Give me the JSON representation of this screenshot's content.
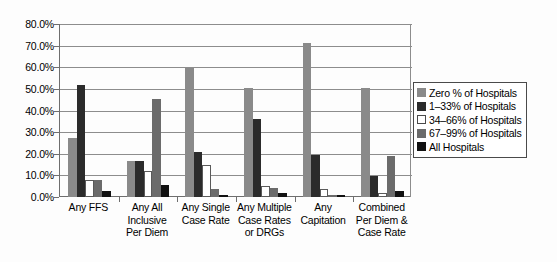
{
  "chart_data": {
    "type": "bar",
    "title": "",
    "xlabel": "",
    "ylabel": "",
    "ylim": [
      0,
      80
    ],
    "ytick_labels": [
      "80.0%",
      "70.0%",
      "60.0%",
      "50.0%",
      "40.0%",
      "30.0%",
      "20.0%",
      "10.0%",
      "0.0%"
    ],
    "ytick_values": [
      80,
      70,
      60,
      50,
      40,
      30,
      20,
      10,
      0
    ],
    "grid": "horizontal",
    "legend_position": "right",
    "categories": [
      "Any FFS",
      "Any All Inclusive Per Diem",
      "Any Single Case Rate",
      "Any Multiple Case Rates or DRGs",
      "Any Capitation",
      "Combined Per Diem & Case Rate"
    ],
    "series": [
      {
        "name": "Zero % of Hospitals",
        "color": "#8a8a8a",
        "values": [
          27.5,
          16.5,
          59.5,
          50.5,
          71.0,
          50.5
        ]
      },
      {
        "name": "1–33% of Hospitals",
        "color": "#2b2b2b",
        "values": [
          52.0,
          16.5,
          21.0,
          36.0,
          19.5,
          9.5
        ]
      },
      {
        "name": "34–66% of Hospitals",
        "color": "#ffffff",
        "values": [
          8.0,
          12.0,
          15.0,
          5.0,
          3.5,
          2.0
        ]
      },
      {
        "name": "67–99% of Hospitals",
        "color": "#6b6b6b",
        "values": [
          8.0,
          45.5,
          3.5,
          4.0,
          1.0,
          19.0
        ]
      },
      {
        "name": "All Hospitals",
        "color": "#111111",
        "values": [
          3.0,
          5.5,
          1.0,
          2.0,
          0.8,
          3.0
        ]
      }
    ]
  },
  "legend": {
    "items": [
      "Zero % of Hospitals",
      "1–33% of Hospitals",
      "34–66% of Hospitals",
      "67–99% of Hospitals",
      "All Hospitals"
    ]
  }
}
